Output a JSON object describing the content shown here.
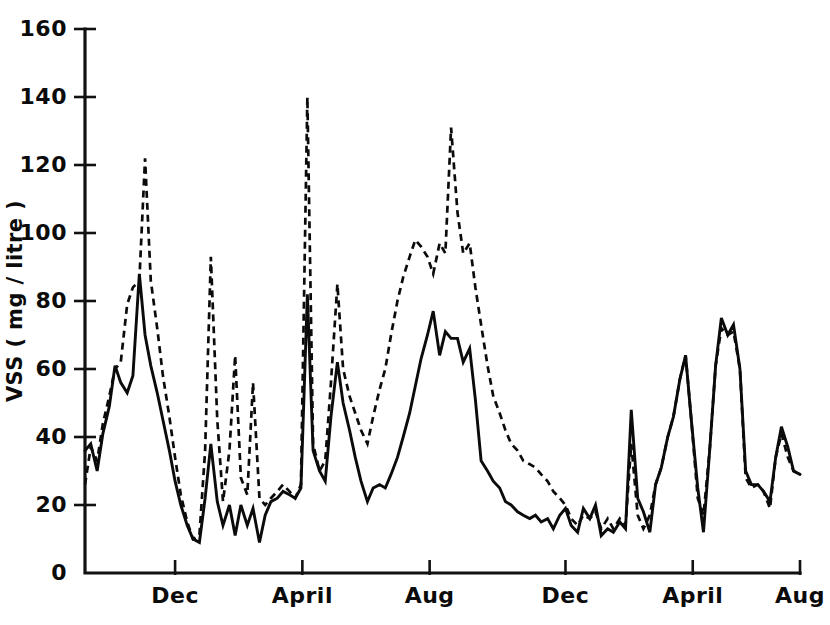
{
  "chart_data": {
    "type": "line",
    "title": "",
    "subtitle": "",
    "xlabel": "",
    "ylabel": "VSS ( mg / litre )",
    "ylim": [
      0,
      160
    ],
    "yticks": [
      0,
      20,
      40,
      60,
      80,
      100,
      120,
      140,
      160
    ],
    "ytick_labels": [
      "0",
      "20",
      "40",
      "60",
      "80",
      "100",
      "120",
      "140",
      "160"
    ],
    "grid": false,
    "legend": "none",
    "xlim": [
      0,
      100
    ],
    "xticks": [
      12.6,
      30.4,
      48.2,
      67.2,
      85.0,
      100.0
    ],
    "xtick_labels": [
      "Dec",
      "April",
      "Aug",
      "Dec",
      "April",
      "Aug"
    ],
    "series": [
      {
        "name": "solid-series",
        "style": "solid",
        "color": "#0b0b0b",
        "x": [
          0.0,
          0.8,
          1.7,
          2.5,
          3.4,
          4.2,
          5.0,
          5.9,
          6.7,
          7.6,
          8.4,
          9.2,
          10.1,
          10.9,
          11.8,
          12.6,
          13.4,
          14.3,
          15.1,
          16.0,
          16.8,
          17.6,
          18.5,
          19.3,
          20.2,
          21.0,
          21.8,
          22.7,
          23.5,
          24.4,
          25.2,
          26.0,
          26.9,
          27.7,
          28.6,
          29.4,
          30.2,
          31.1,
          31.9,
          32.8,
          33.6,
          34.4,
          35.3,
          36.1,
          37.0,
          37.8,
          38.6,
          39.5,
          40.3,
          41.2,
          42.0,
          42.8,
          43.7,
          44.5,
          45.4,
          46.2,
          47.0,
          47.9,
          48.7,
          49.6,
          50.4,
          51.2,
          52.1,
          52.9,
          53.8,
          54.6,
          55.4,
          56.3,
          57.1,
          58.0,
          58.8,
          59.6,
          60.5,
          61.3,
          62.2,
          63.0,
          63.8,
          64.7,
          65.5,
          66.4,
          67.2,
          68.0,
          68.9,
          69.7,
          70.6,
          71.4,
          72.2,
          73.1,
          73.9,
          74.8,
          75.6,
          76.4,
          77.3,
          78.1,
          79.0,
          79.8,
          80.6,
          81.5,
          82.3,
          83.2,
          84.0,
          84.8,
          85.7,
          86.5,
          87.4,
          88.2,
          89.0,
          89.9,
          90.7,
          91.6,
          92.4,
          93.2,
          94.1,
          94.9,
          95.8,
          96.6,
          97.4,
          98.3,
          99.1,
          100.0
        ],
        "y": [
          36,
          38,
          30,
          41,
          49,
          61,
          56,
          53,
          58,
          88,
          70,
          61,
          53,
          45,
          36,
          27,
          20,
          14,
          10,
          9,
          22,
          38,
          21,
          14,
          20,
          11,
          20,
          14,
          19,
          9,
          17,
          21,
          22,
          24,
          23,
          22,
          25,
          82,
          36,
          30,
          27,
          46,
          62,
          50,
          42,
          34,
          27,
          21,
          25,
          26,
          25,
          29,
          34,
          40,
          47,
          55,
          63,
          70,
          77,
          64,
          71,
          69,
          69,
          62,
          66,
          51,
          33,
          30,
          27,
          25,
          21,
          20,
          18,
          17,
          16,
          17,
          15,
          16,
          13,
          17,
          19,
          14,
          12,
          19,
          16,
          20,
          11,
          13,
          12,
          15,
          13,
          48,
          22,
          18,
          12,
          26,
          31,
          40,
          46,
          57,
          64,
          45,
          25,
          12,
          37,
          61,
          75,
          70,
          73,
          60,
          30,
          26,
          26,
          24,
          21,
          34,
          43,
          37,
          30,
          29
        ]
      },
      {
        "name": "dashed-series",
        "style": "dashed",
        "color": "#0b0b0b",
        "x": [
          0.0,
          0.8,
          1.7,
          2.5,
          3.4,
          4.2,
          5.0,
          5.9,
          6.7,
          7.6,
          8.4,
          9.2,
          10.1,
          10.9,
          11.8,
          12.6,
          13.4,
          14.3,
          15.1,
          16.0,
          16.8,
          17.6,
          18.5,
          19.3,
          20.2,
          21.0,
          21.8,
          22.7,
          23.5,
          24.4,
          25.2,
          26.0,
          26.9,
          27.7,
          28.6,
          29.4,
          30.2,
          31.1,
          31.9,
          32.8,
          33.6,
          34.4,
          35.3,
          36.1,
          37.0,
          37.8,
          38.6,
          39.5,
          40.3,
          41.2,
          42.0,
          42.8,
          43.7,
          44.5,
          45.4,
          46.2,
          47.0,
          47.9,
          48.7,
          49.6,
          50.4,
          51.2,
          52.1,
          52.9,
          53.8,
          54.6,
          55.4,
          56.3,
          57.1,
          58.0,
          58.8,
          59.6,
          60.5,
          61.3,
          62.2,
          63.0,
          63.8,
          64.7,
          65.5,
          66.4,
          67.2,
          68.0,
          68.9,
          69.7,
          70.6,
          71.4,
          72.2,
          73.1,
          73.9,
          74.8,
          75.6,
          76.4,
          77.3,
          78.1,
          79.0,
          79.8,
          80.6,
          81.5,
          82.3,
          83.2,
          84.0,
          84.8,
          85.7,
          86.5,
          87.4,
          88.2,
          89.0,
          89.9,
          90.7,
          91.6,
          92.4,
          93.2,
          94.1,
          94.9,
          95.8,
          96.6,
          97.4,
          98.3,
          99.1,
          100.0
        ],
        "y": [
          26,
          37,
          33,
          44,
          52,
          60,
          62,
          79,
          84,
          86,
          122,
          86,
          72,
          58,
          46,
          34,
          23,
          15,
          10,
          11,
          36,
          93,
          45,
          21,
          36,
          64,
          28,
          23,
          56,
          22,
          20,
          22,
          24,
          26,
          24,
          22,
          26,
          140,
          38,
          30,
          33,
          56,
          85,
          60,
          52,
          47,
          42,
          38,
          46,
          54,
          60,
          70,
          80,
          87,
          93,
          98,
          96,
          93,
          88,
          97,
          94,
          131,
          106,
          94,
          97,
          84,
          73,
          61,
          52,
          47,
          42,
          38,
          36,
          33,
          32,
          31,
          29,
          27,
          24,
          22,
          20,
          16,
          14,
          17,
          16,
          18,
          13,
          16,
          13,
          16,
          14,
          38,
          17,
          13,
          17,
          26,
          31,
          40,
          46,
          57,
          64,
          45,
          22,
          17,
          37,
          61,
          72,
          70,
          71,
          60,
          28,
          25,
          26,
          24,
          19,
          34,
          41,
          34,
          30,
          29
        ]
      }
    ]
  },
  "axis": {
    "y_title": "VSS ( mg / litre )"
  }
}
